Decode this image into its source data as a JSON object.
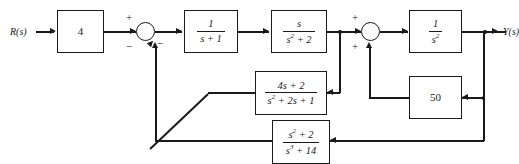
{
  "diagram": {
    "type": "control-system-block-diagram",
    "input_label": "R(s)",
    "output_label": "Y(s)",
    "blocks": [
      {
        "id": "gain4",
        "label": "4",
        "kind": "gain"
      },
      {
        "id": "lag",
        "numerator": "1",
        "denominator": "s + 1",
        "kind": "transfer-function"
      },
      {
        "id": "resonator",
        "numerator": "s",
        "denominator": "s2 + 2",
        "kind": "transfer-function"
      },
      {
        "id": "double-integrator",
        "numerator": "1",
        "denominator": "s2",
        "kind": "transfer-function"
      },
      {
        "id": "inner-feedback",
        "numerator": "4s + 2",
        "denominator": "s2 + 2s + 1",
        "kind": "transfer-function"
      },
      {
        "id": "gain50",
        "label": "50",
        "kind": "gain"
      },
      {
        "id": "outer-feedback",
        "numerator": "s2 + 2",
        "denominator": "s3 + 14",
        "kind": "transfer-function"
      }
    ],
    "summing_junctions": [
      {
        "id": "summer-1",
        "signs": {
          "input": "+",
          "bottom": "−",
          "right": "−"
        }
      },
      {
        "id": "summer-2",
        "signs": {
          "input": "+",
          "bottom": "+"
        }
      }
    ],
    "signs": {
      "plus": "+",
      "minus": "−"
    },
    "colors": {
      "line": "#1a1a1a",
      "background": "#ffffff"
    }
  }
}
